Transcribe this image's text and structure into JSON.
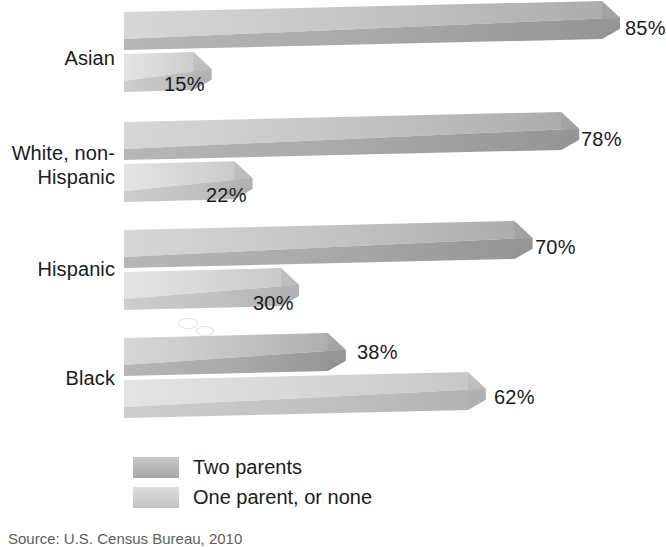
{
  "chart_data": {
    "type": "bar",
    "orientation": "horizontal",
    "title": "",
    "xlabel": "",
    "ylabel": "",
    "xlim": [
      0,
      85
    ],
    "grid": false,
    "legend_position": "bottom-left",
    "categories": [
      "Asian",
      "White, non-\nHispanic",
      "Hispanic",
      "Black"
    ],
    "series": [
      {
        "name": "Two parents",
        "color": "#b0b0b0",
        "values": [
          85,
          78,
          70,
          38
        ],
        "labels": [
          "85%",
          "78%",
          "70%",
          "38%"
        ]
      },
      {
        "name": "One parent, or none",
        "color": "#cfcfcf",
        "values": [
          15,
          22,
          30,
          62
        ],
        "labels": [
          "15%",
          "22%",
          "30%",
          "62%"
        ]
      }
    ]
  },
  "legend": {
    "items": [
      {
        "label": "Two parents",
        "swatch": "two"
      },
      {
        "label": "One parent, or none",
        "swatch": "one"
      }
    ]
  },
  "source": {
    "text": "Source: U.S. Census Bureau, 2010"
  }
}
